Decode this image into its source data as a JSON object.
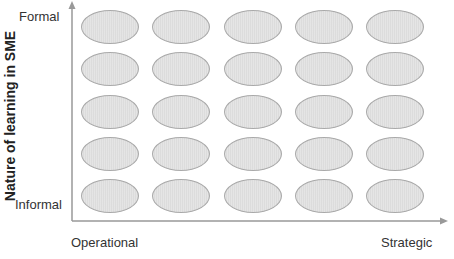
{
  "diagram": {
    "y_axis": {
      "title": "Nature of learning in SME",
      "top_label": "Formal",
      "bottom_label": "Informal"
    },
    "x_axis": {
      "left_label": "Operational",
      "right_label": "Strategic"
    },
    "grid": {
      "rows": 5,
      "columns": 5,
      "shape": "ellipse",
      "fill_color": "#dcdcdc",
      "stroke_color": "#a9a9a9"
    },
    "axis_color": "#999999"
  }
}
